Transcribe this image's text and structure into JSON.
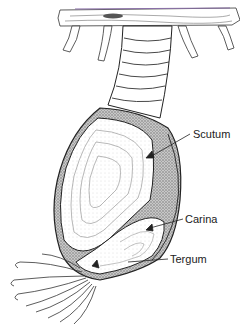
{
  "diagram": {
    "labels": [
      {
        "id": "scutum",
        "text": "Scutum",
        "x": 193,
        "y": 128
      },
      {
        "id": "carina",
        "text": "Carina",
        "x": 185,
        "y": 213
      },
      {
        "id": "tergum",
        "text": "Tergum",
        "x": 170,
        "y": 253
      }
    ],
    "colors": {
      "ink": "#222222",
      "shading": "#9a9a9a",
      "substrate_tint": "#8a6fa8",
      "background": "#ffffff"
    }
  }
}
